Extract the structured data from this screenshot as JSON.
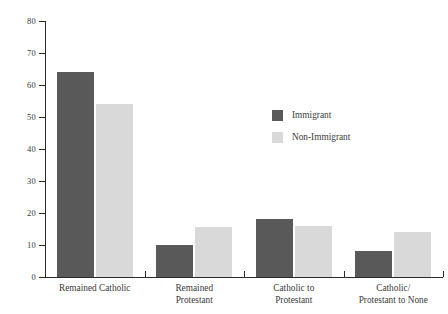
{
  "chart_data": {
    "type": "bar",
    "title": "",
    "xlabel": "",
    "ylabel": "",
    "ylim": [
      0,
      80
    ],
    "yticks": [
      0,
      10,
      20,
      30,
      40,
      50,
      60,
      70,
      80
    ],
    "ytick_labels": [
      "0",
      "10",
      "20",
      "30",
      "40",
      "50",
      "60",
      "70",
      "80"
    ],
    "grid": false,
    "legend_position": "center-right",
    "categories": [
      "Remained Catholic",
      "Remained\nProtestant",
      "Catholic to\nProtestant",
      "Catholic/\nProtestant to None"
    ],
    "category_lines": [
      [
        "Remained Catholic"
      ],
      [
        "Remained",
        "Protestant"
      ],
      [
        "Catholic to",
        "Protestant"
      ],
      [
        "Catholic/",
        "Protestant to None"
      ]
    ],
    "series": [
      {
        "name": "Immigrant",
        "color": "#595959",
        "values": [
          64,
          10,
          18,
          8
        ]
      },
      {
        "name": "Non-Immigrant",
        "color": "#d9d9d9",
        "values": [
          54,
          15.5,
          16,
          14
        ]
      }
    ]
  },
  "legend": {
    "entries": [
      {
        "label": "Immigrant",
        "color": "#595959"
      },
      {
        "label": "Non-Immigrant",
        "color": "#d9d9d9"
      }
    ]
  },
  "colors": {
    "immigrant": "#595959",
    "nonimmigrant": "#d9d9d9",
    "axis": "#2b2b2b",
    "text": "#3a3a3a",
    "background": "#ffffff"
  }
}
